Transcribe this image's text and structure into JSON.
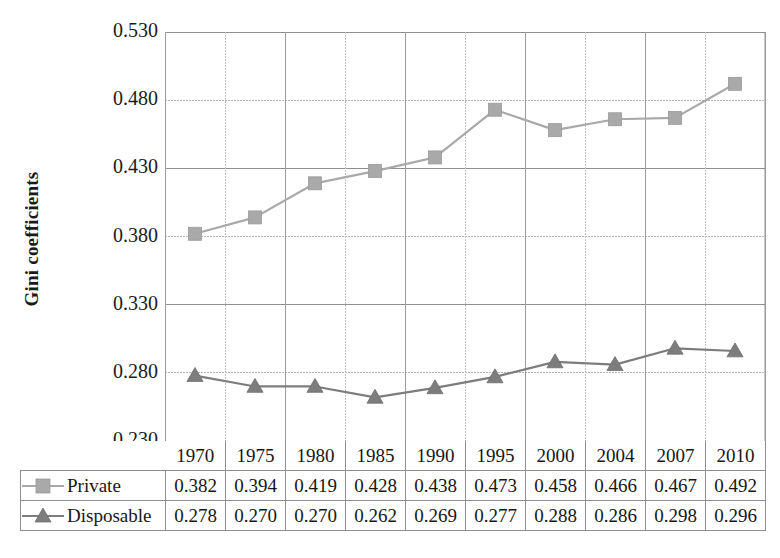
{
  "chart_data": {
    "type": "line",
    "title": "",
    "xlabel": "",
    "ylabel": "Gini coefficients",
    "categories": [
      "1970",
      "1975",
      "1980",
      "1985",
      "1990",
      "1995",
      "2000",
      "2004",
      "2007",
      "2010"
    ],
    "series": [
      {
        "name": "Private",
        "marker": "square",
        "color": "#a9a9a9",
        "line_style": "solid",
        "values": [
          0.382,
          0.394,
          0.419,
          0.428,
          0.438,
          0.473,
          0.458,
          0.466,
          0.467,
          0.492
        ]
      },
      {
        "name": "Disposable",
        "marker": "triangle",
        "color": "#7d7d7d",
        "line_style": "solid",
        "values": [
          0.278,
          0.27,
          0.27,
          0.262,
          0.269,
          0.277,
          0.288,
          0.286,
          0.298,
          0.296
        ]
      }
    ],
    "ylim": [
      0.23,
      0.53
    ],
    "ytick_labels": [
      "0.530",
      "0.480",
      "0.430",
      "0.380",
      "0.330",
      "0.280",
      "0.230"
    ],
    "ytick_values": [
      0.53,
      0.48,
      0.43,
      0.38,
      0.33,
      0.28,
      0.23
    ],
    "grid": true,
    "legend_position": "bottom-table"
  },
  "axis": {
    "y_title": "Gini coefficients"
  },
  "table": {
    "corner_label": "",
    "row_labels": [
      "Private",
      "Disposable"
    ]
  }
}
